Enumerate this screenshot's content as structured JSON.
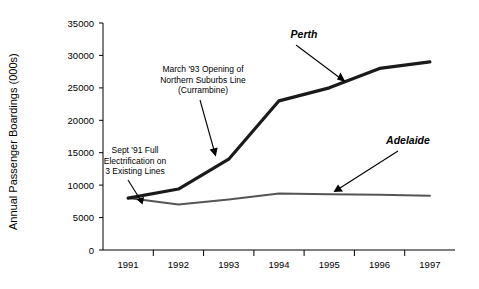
{
  "chart_data": {
    "type": "line",
    "title": "",
    "xlabel": "",
    "ylabel": "Annual Passenger Boardings (000s)",
    "categories": [
      "1991",
      "1992",
      "1993",
      "1994",
      "1995",
      "1996",
      "1997"
    ],
    "ylim": [
      0,
      35000
    ],
    "ytick_labels": [
      "35000",
      "30000",
      "25000",
      "20000",
      "15000",
      "10000",
      "5000",
      "0"
    ],
    "ytick_values": [
      35000,
      30000,
      25000,
      20000,
      15000,
      10000,
      5000,
      0
    ],
    "grid": false,
    "legend_position": "inline-annotations",
    "series": [
      {
        "name": "Perth",
        "color": "#1a1a1a",
        "line_width": 3.2,
        "values": [
          8000,
          9400,
          14000,
          23000,
          25000,
          28000,
          29000
        ]
      },
      {
        "name": "Adelaide",
        "color": "#555555",
        "line_width": 2.0,
        "values": [
          8000,
          7000,
          7800,
          8700,
          8600,
          8500,
          8350
        ]
      }
    ],
    "annotations": [
      {
        "id": "annotation-electrification",
        "lines": [
          "Sept '91 Full",
          "Electrification on",
          "3 Existing Lines"
        ],
        "target_category": "1991",
        "target_value": 8400
      },
      {
        "id": "annotation-northern-suburbs",
        "lines": [
          "March '93 Opening of",
          "Northern Suburbs Line",
          "(Currambine)"
        ],
        "target_category": "1993",
        "target_value": 14800
      }
    ],
    "series_labels": [
      {
        "id": "series-label-perth",
        "text": "Perth"
      },
      {
        "id": "series-label-adelaide",
        "text": "Adelaide"
      }
    ]
  }
}
